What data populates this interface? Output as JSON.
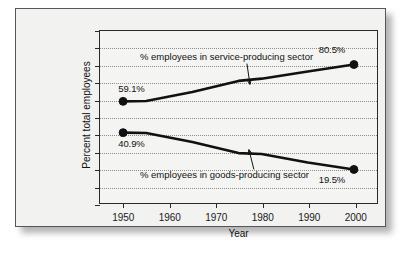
{
  "chart_data": {
    "type": "line",
    "title": "",
    "xlabel": "Year",
    "ylabel": "Percent total employees",
    "xlim": [
      1945,
      2005
    ],
    "ylim": [
      0,
      100
    ],
    "grid": true,
    "legend_position": "inline-annotations",
    "x_ticks": [
      "1950",
      "1960",
      "1970",
      "1980",
      "1990",
      "2000"
    ],
    "x_tick_values": [
      1950,
      1960,
      1970,
      1980,
      1990,
      2000
    ],
    "y_ticks": [
      "0.0%",
      "10.0%",
      "20.0%",
      "30.0%",
      "40.0%",
      "50.0%",
      "60.0%",
      "70.0%",
      "80.0%",
      "90.0%",
      "100.0%"
    ],
    "y_tick_values": [
      0,
      10,
      20,
      30,
      40,
      50,
      60,
      70,
      80,
      90,
      100
    ],
    "series": [
      {
        "name": "% employees in service-producing sector",
        "x": [
          1950,
          1955,
          1965,
          1975,
          1980,
          1990,
          2000
        ],
        "values": [
          59.1,
          59.3,
          64.5,
          71.0,
          72.3,
          76.5,
          80.5
        ]
      },
      {
        "name": "% employees in goods-producing sector",
        "x": [
          1950,
          1955,
          1965,
          1975,
          1980,
          1990,
          2000
        ],
        "values": [
          40.9,
          40.7,
          35.5,
          29.0,
          28.5,
          23.5,
          19.5
        ]
      }
    ],
    "annotations": [
      {
        "text": "% employees in service-producing sector",
        "target_x": 1977,
        "target_y": 71.6
      },
      {
        "text": "% employees in goods-producing sector",
        "target_x": 1978,
        "target_y": 28.8
      }
    ],
    "value_labels": [
      {
        "text": "59.1%",
        "x": 1950,
        "y": 59.1,
        "position": "above-right"
      },
      {
        "text": "80.5%",
        "x": 2000,
        "y": 80.5,
        "position": "above-left"
      },
      {
        "text": "40.9%",
        "x": 1950,
        "y": 40.9,
        "position": "below-right"
      },
      {
        "text": "19.5%",
        "x": 2000,
        "y": 19.5,
        "position": "below-left"
      }
    ],
    "colors": {
      "line": "#111111",
      "marker": "#111111",
      "grid": "#8d8d8d",
      "axis": "#2a2a2a",
      "panel_background": "#f2f2f0"
    }
  }
}
